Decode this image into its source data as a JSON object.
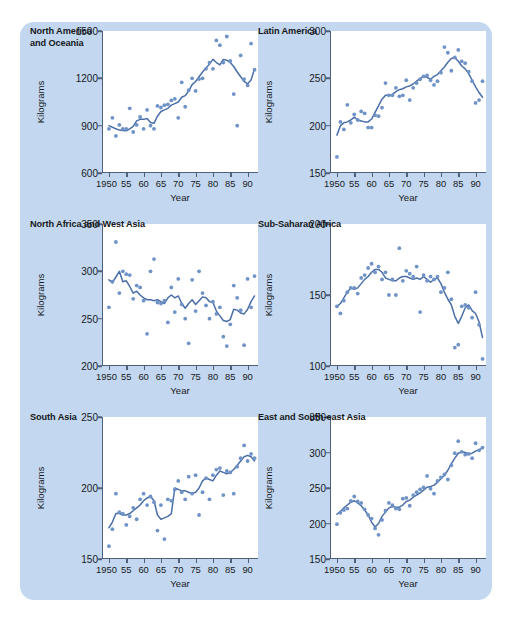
{
  "figure": {
    "background_color": "#c3d8f0",
    "dot_color": "#6f93c6",
    "line_color": "#4a6fa8",
    "axis_color": "#4f5f77"
  },
  "chart_data": [
    {
      "type": "scatter",
      "panel_index": 0,
      "title": "North America\nand Oceania",
      "xlabel": "Year",
      "ylabel": "Kilograms",
      "xlim": [
        1948,
        1993
      ],
      "ylim": [
        600,
        1500
      ],
      "yticks": [
        600,
        900,
        1200,
        1500
      ],
      "ytick_labels": [
        "600",
        "900",
        "1200",
        "1500"
      ],
      "xticks": [
        1950,
        1955,
        1960,
        1965,
        1970,
        1975,
        1980,
        1985,
        1990
      ],
      "xtick_labels": [
        "1950",
        "55",
        "60",
        "65",
        "70",
        "75",
        "80",
        "85",
        "90"
      ],
      "grid": false,
      "legend": "none",
      "x": [
        1950,
        1951,
        1952,
        1953,
        1954,
        1955,
        1956,
        1957,
        1958,
        1959,
        1960,
        1961,
        1962,
        1963,
        1964,
        1965,
        1966,
        1967,
        1968,
        1969,
        1970,
        1971,
        1972,
        1973,
        1974,
        1975,
        1976,
        1977,
        1978,
        1979,
        1980,
        1981,
        1982,
        1983,
        1984,
        1985,
        1986,
        1987,
        1988,
        1989,
        1990,
        1991,
        1992
      ],
      "values": [
        880,
        950,
        835,
        905,
        880,
        880,
        1010,
        860,
        905,
        955,
        880,
        1000,
        900,
        880,
        1025,
        1015,
        1030,
        1035,
        1060,
        1070,
        950,
        1175,
        1020,
        1125,
        1200,
        1120,
        1195,
        1200,
        1260,
        1300,
        1260,
        1440,
        1410,
        1300,
        1465,
        1310,
        1100,
        900,
        1345,
        1195,
        1155,
        1420,
        1255
      ],
      "trend_x": [
        1950,
        1951,
        1952,
        1953,
        1954,
        1955,
        1956,
        1957,
        1958,
        1959,
        1960,
        1961,
        1962,
        1963,
        1964,
        1965,
        1966,
        1967,
        1968,
        1969,
        1970,
        1971,
        1972,
        1973,
        1974,
        1975,
        1976,
        1977,
        1978,
        1979,
        1980,
        1981,
        1982,
        1983,
        1984,
        1985,
        1986,
        1987,
        1988,
        1989,
        1990,
        1991,
        1992
      ],
      "trend_values": [
        900,
        890,
        880,
        872,
        870,
        868,
        880,
        895,
        930,
        940,
        940,
        945,
        920,
        915,
        960,
        990,
        1000,
        1010,
        1030,
        1040,
        1050,
        1080,
        1090,
        1120,
        1160,
        1180,
        1210,
        1240,
        1265,
        1290,
        1320,
        1300,
        1285,
        1320,
        1315,
        1300,
        1275,
        1240,
        1210,
        1180,
        1165,
        1190,
        1260
      ]
    },
    {
      "type": "scatter",
      "panel_index": 1,
      "title": "Latin America",
      "xlabel": "Year",
      "ylabel": "Kilograms",
      "xlim": [
        1948,
        1993
      ],
      "ylim": [
        150,
        300
      ],
      "yticks": [
        150,
        200,
        250,
        300
      ],
      "ytick_labels": [
        "150",
        "200",
        "250",
        "300"
      ],
      "xticks": [
        1950,
        1955,
        1960,
        1965,
        1970,
        1975,
        1980,
        1985,
        1990
      ],
      "xtick_labels": [
        "1950",
        "55",
        "60",
        "65",
        "70",
        "75",
        "80",
        "85",
        "90"
      ],
      "grid": false,
      "legend": "none",
      "x": [
        1950,
        1951,
        1952,
        1953,
        1954,
        1955,
        1956,
        1957,
        1958,
        1959,
        1960,
        1961,
        1962,
        1963,
        1964,
        1965,
        1966,
        1967,
        1968,
        1969,
        1970,
        1971,
        1972,
        1973,
        1974,
        1975,
        1976,
        1977,
        1978,
        1979,
        1980,
        1981,
        1982,
        1983,
        1984,
        1985,
        1986,
        1987,
        1988,
        1989,
        1990,
        1991,
        1992
      ],
      "values": [
        167,
        204,
        196,
        222,
        203,
        212,
        206,
        215,
        213,
        198,
        198,
        211,
        210,
        219,
        245,
        232,
        232,
        240,
        231,
        232,
        248,
        227,
        240,
        245,
        249,
        252,
        253,
        248,
        243,
        247,
        256,
        283,
        277,
        258,
        272,
        280,
        268,
        266,
        257,
        247,
        224,
        227,
        247
      ],
      "trend_x": [
        1950,
        1951,
        1952,
        1953,
        1954,
        1955,
        1956,
        1957,
        1958,
        1959,
        1960,
        1961,
        1962,
        1963,
        1964,
        1965,
        1966,
        1967,
        1968,
        1969,
        1970,
        1971,
        1972,
        1973,
        1974,
        1975,
        1976,
        1977,
        1978,
        1979,
        1980,
        1981,
        1982,
        1983,
        1984,
        1985,
        1986,
        1987,
        1988,
        1989,
        1990,
        1991,
        1992
      ],
      "trend_values": [
        190,
        200,
        203,
        204,
        206,
        209,
        206,
        205,
        204,
        204,
        207,
        214,
        221,
        228,
        232,
        232,
        233,
        236,
        238,
        239,
        241,
        242,
        244,
        247,
        250,
        252,
        251,
        249,
        252,
        254,
        258,
        262,
        267,
        271,
        272,
        268,
        263,
        260,
        255,
        248,
        241,
        235,
        230
      ]
    },
    {
      "type": "scatter",
      "panel_index": 2,
      "title": "North Africa and West Asia",
      "xlabel": "Year",
      "ylabel": "Kilograms",
      "xlim": [
        1948,
        1993
      ],
      "ylim": [
        200,
        350
      ],
      "yticks": [
        200,
        250,
        300,
        350
      ],
      "ytick_labels": [
        "200",
        "250",
        "300",
        "350"
      ],
      "xticks": [
        1950,
        1955,
        1960,
        1965,
        1970,
        1975,
        1980,
        1985,
        1990
      ],
      "xtick_labels": [
        "1950",
        "55",
        "60",
        "65",
        "70",
        "75",
        "80",
        "85",
        "90"
      ],
      "grid": false,
      "legend": "none",
      "x": [
        1950,
        1951,
        1952,
        1953,
        1954,
        1955,
        1956,
        1957,
        1958,
        1959,
        1960,
        1961,
        1962,
        1963,
        1964,
        1965,
        1966,
        1967,
        1968,
        1969,
        1970,
        1971,
        1972,
        1973,
        1974,
        1975,
        1976,
        1977,
        1978,
        1979,
        1980,
        1981,
        1982,
        1983,
        1984,
        1985,
        1986,
        1987,
        1988,
        1989,
        1990,
        1991,
        1992
      ],
      "values": [
        262,
        289,
        331,
        277,
        300,
        297,
        296,
        271,
        285,
        283,
        269,
        234,
        300,
        313,
        267,
        266,
        269,
        246,
        283,
        257,
        292,
        265,
        250,
        224,
        291,
        258,
        300,
        277,
        264,
        250,
        268,
        255,
        262,
        231,
        221,
        244,
        285,
        272,
        259,
        222,
        292,
        262,
        295
      ],
      "trend_x": [
        1950,
        1951,
        1952,
        1953,
        1954,
        1955,
        1956,
        1957,
        1958,
        1959,
        1960,
        1961,
        1962,
        1963,
        1964,
        1965,
        1966,
        1967,
        1968,
        1969,
        1970,
        1971,
        1972,
        1973,
        1974,
        1975,
        1976,
        1977,
        1978,
        1979,
        1980,
        1981,
        1982,
        1983,
        1984,
        1985,
        1986,
        1987,
        1988,
        1989,
        1990,
        1991,
        1992
      ],
      "trend_values": [
        291,
        288,
        294,
        300,
        289,
        290,
        284,
        277,
        279,
        275,
        272,
        270,
        270,
        269,
        270,
        268,
        266,
        272,
        275,
        272,
        274,
        266,
        261,
        266,
        270,
        265,
        269,
        273,
        272,
        268,
        267,
        258,
        253,
        248,
        247,
        249,
        260,
        259,
        256,
        255,
        260,
        268,
        274
      ]
    },
    {
      "type": "scatter",
      "panel_index": 3,
      "title": "Sub-Saharan Africa",
      "xlabel": "Year",
      "ylabel": "Kilograms",
      "xlim": [
        1948,
        1993
      ],
      "ylim": [
        100,
        200
      ],
      "yticks": [
        100,
        150,
        200
      ],
      "ytick_labels": [
        "100",
        "150",
        "200"
      ],
      "xticks": [
        1950,
        1955,
        1960,
        1965,
        1970,
        1975,
        1980,
        1985,
        1990
      ],
      "xtick_labels": [
        "1950",
        "55",
        "60",
        "65",
        "70",
        "75",
        "80",
        "85",
        "90"
      ],
      "grid": false,
      "legend": "none",
      "x": [
        1950,
        1951,
        1952,
        1953,
        1954,
        1955,
        1956,
        1957,
        1958,
        1959,
        1960,
        1961,
        1962,
        1963,
        1964,
        1965,
        1966,
        1967,
        1968,
        1969,
        1970,
        1971,
        1972,
        1973,
        1974,
        1975,
        1976,
        1977,
        1978,
        1979,
        1980,
        1981,
        1982,
        1983,
        1984,
        1985,
        1986,
        1987,
        1988,
        1989,
        1990,
        1991,
        1992
      ],
      "values": [
        142,
        137,
        146,
        152,
        155,
        155,
        151,
        162,
        164,
        169,
        172,
        166,
        170,
        161,
        166,
        150,
        161,
        150,
        183,
        160,
        167,
        165,
        163,
        170,
        138,
        164,
        160,
        163,
        161,
        163,
        152,
        155,
        166,
        147,
        113,
        115,
        142,
        143,
        141,
        134,
        152,
        129,
        105
      ],
      "trend_x": [
        1950,
        1951,
        1952,
        1953,
        1954,
        1955,
        1956,
        1957,
        1958,
        1959,
        1960,
        1961,
        1962,
        1963,
        1964,
        1965,
        1966,
        1967,
        1968,
        1969,
        1970,
        1971,
        1972,
        1973,
        1974,
        1975,
        1976,
        1977,
        1978,
        1979,
        1980,
        1981,
        1982,
        1983,
        1984,
        1985,
        1986,
        1987,
        1988,
        1989,
        1990,
        1991,
        1992
      ],
      "trend_values": [
        142,
        144,
        148,
        152,
        155,
        154,
        155,
        158,
        161,
        163,
        166,
        168,
        168,
        166,
        162,
        161,
        160,
        160,
        162,
        163,
        163,
        162,
        161,
        162,
        161,
        163,
        161,
        159,
        161,
        162,
        158,
        152,
        147,
        143,
        135,
        130,
        135,
        141,
        143,
        139,
        137,
        131,
        120
      ]
    },
    {
      "type": "scatter",
      "panel_index": 4,
      "title": "South Asia",
      "xlabel": "Year",
      "ylabel": "Kilograms",
      "xlim": [
        1948,
        1993
      ],
      "ylim": [
        150,
        250
      ],
      "yticks": [
        150,
        200,
        250
      ],
      "ytick_labels": [
        "150",
        "200",
        "250"
      ],
      "xticks": [
        1950,
        1955,
        1960,
        1965,
        1970,
        1975,
        1980,
        1985,
        1990
      ],
      "xtick_labels": [
        "1950",
        "55",
        "60",
        "65",
        "70",
        "75",
        "80",
        "85",
        "90"
      ],
      "grid": false,
      "legend": "none",
      "x": [
        1950,
        1951,
        1952,
        1953,
        1954,
        1955,
        1956,
        1957,
        1958,
        1959,
        1960,
        1961,
        1962,
        1963,
        1964,
        1965,
        1966,
        1967,
        1968,
        1969,
        1970,
        1971,
        1972,
        1973,
        1974,
        1975,
        1976,
        1977,
        1978,
        1979,
        1980,
        1981,
        1982,
        1983,
        1984,
        1985,
        1986,
        1987,
        1988,
        1989,
        1990,
        1991,
        1992
      ],
      "values": [
        159,
        171,
        196,
        183,
        182,
        174,
        180,
        186,
        178,
        192,
        196,
        188,
        194,
        190,
        170,
        188,
        164,
        192,
        191,
        199,
        205,
        197,
        192,
        208,
        196,
        209,
        181,
        197,
        207,
        192,
        209,
        213,
        214,
        195,
        212,
        211,
        196,
        215,
        221,
        230,
        219,
        224,
        221
      ],
      "trend_x": [
        1950,
        1951,
        1952,
        1953,
        1954,
        1955,
        1956,
        1957,
        1958,
        1959,
        1960,
        1961,
        1962,
        1963,
        1964,
        1965,
        1966,
        1967,
        1968,
        1969,
        1970,
        1971,
        1972,
        1973,
        1974,
        1975,
        1976,
        1977,
        1978,
        1979,
        1980,
        1981,
        1982,
        1983,
        1984,
        1985,
        1986,
        1987,
        1988,
        1989,
        1990,
        1991,
        1992
      ],
      "trend_values": [
        172,
        176,
        182,
        182,
        181,
        181,
        182,
        184,
        186,
        188,
        191,
        193,
        194,
        191,
        181,
        178,
        179,
        180,
        182,
        200,
        199,
        198,
        198,
        197,
        196,
        197,
        200,
        205,
        207,
        206,
        205,
        209,
        212,
        211,
        210,
        211,
        213,
        216,
        219,
        222,
        223,
        222,
        219
      ]
    },
    {
      "type": "scatter",
      "panel_index": 5,
      "title": "East and South-east Asia",
      "xlabel": "Year",
      "ylabel": "Kilograms",
      "xlim": [
        1948,
        1993
      ],
      "ylim": [
        150,
        350
      ],
      "yticks": [
        150,
        200,
        250,
        300,
        350
      ],
      "ytick_labels": [
        "150",
        "200",
        "250",
        "300",
        "350"
      ],
      "xticks": [
        1950,
        1955,
        1960,
        1965,
        1970,
        1975,
        1980,
        1985,
        1990
      ],
      "xtick_labels": [
        "1950",
        "55",
        "60",
        "65",
        "70",
        "75",
        "80",
        "85",
        "90"
      ],
      "grid": false,
      "legend": "none",
      "x": [
        1950,
        1951,
        1952,
        1953,
        1954,
        1955,
        1956,
        1957,
        1958,
        1959,
        1960,
        1961,
        1962,
        1963,
        1964,
        1965,
        1966,
        1967,
        1968,
        1969,
        1970,
        1971,
        1972,
        1973,
        1974,
        1975,
        1976,
        1977,
        1978,
        1979,
        1980,
        1981,
        1982,
        1983,
        1984,
        1985,
        1986,
        1987,
        1988,
        1989,
        1990,
        1991,
        1992
      ],
      "values": [
        199,
        215,
        219,
        221,
        232,
        238,
        231,
        229,
        220,
        212,
        207,
        193,
        184,
        205,
        218,
        229,
        226,
        221,
        220,
        235,
        236,
        225,
        240,
        244,
        248,
        251,
        267,
        249,
        242,
        260,
        265,
        269,
        262,
        282,
        299,
        316,
        301,
        297,
        298,
        292,
        313,
        303,
        307
      ],
      "trend_x": [
        1950,
        1951,
        1952,
        1953,
        1954,
        1955,
        1956,
        1957,
        1958,
        1959,
        1960,
        1961,
        1962,
        1963,
        1964,
        1965,
        1966,
        1967,
        1968,
        1969,
        1970,
        1971,
        1972,
        1973,
        1974,
        1975,
        1976,
        1977,
        1978,
        1979,
        1980,
        1981,
        1982,
        1983,
        1984,
        1985,
        1986,
        1987,
        1988,
        1989,
        1990,
        1991,
        1992
      ],
      "trend_values": [
        213,
        217,
        222,
        226,
        230,
        232,
        229,
        225,
        219,
        212,
        202,
        195,
        200,
        210,
        216,
        222,
        224,
        223,
        223,
        226,
        231,
        233,
        237,
        240,
        243,
        247,
        251,
        252,
        254,
        258,
        263,
        268,
        275,
        284,
        292,
        299,
        301,
        300,
        298,
        299,
        302,
        304,
        306
      ]
    }
  ]
}
